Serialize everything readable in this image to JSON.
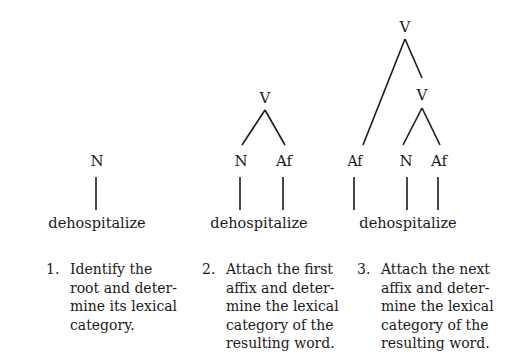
{
  "word": "dehospitalize",
  "trees": [
    {
      "step": "1.",
      "nodes": {
        "root": "N"
      },
      "caption": "Identify the\nroot and deter-\nmine its lexical\ncategory."
    },
    {
      "step": "2.",
      "nodes": {
        "top": "V",
        "left": "N",
        "right": "Af"
      },
      "caption": "Attach the first\naffix and deter-\nmine the lexical\ncategory of the\nresulting word."
    },
    {
      "step": "3.",
      "nodes": {
        "top": "V",
        "mid": "V",
        "left": "Af",
        "center": "N",
        "right": "Af"
      },
      "caption": "Attach the next\naffix and deter-\nmine the lexical\ncategory of the\nresulting word."
    }
  ]
}
